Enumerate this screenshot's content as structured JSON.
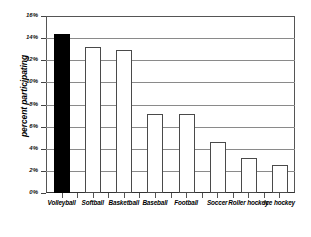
{
  "chart_data": {
    "type": "bar",
    "title": "",
    "xlabel": "",
    "ylabel": "percent participating",
    "ylim": [
      0,
      16
    ],
    "grid": true,
    "legend": "none",
    "y_tick_labels": [
      "16%",
      "14%",
      "12%",
      "10%",
      "8%",
      "6%",
      "4%",
      "2%",
      "0%"
    ],
    "y_tick_values": [
      16,
      14,
      12,
      10,
      8,
      6,
      4,
      2,
      0
    ],
    "categories": [
      "Volleyball",
      "Softball",
      "Basketball",
      "Baseball",
      "Football",
      "Soccer",
      "Roller hockey",
      "Ice hockey"
    ],
    "values": [
      14.4,
      13.2,
      12.9,
      7.1,
      7.1,
      4.6,
      3.2,
      2.5
    ],
    "highlighted_category": "Volleyball",
    "bar_fill_default": "#ffffff",
    "bar_fill_highlight": "#000000",
    "bar_edge_color": "#4a4a4a",
    "gridline_color": "#8a8a8a",
    "axis_color": "#555555"
  }
}
